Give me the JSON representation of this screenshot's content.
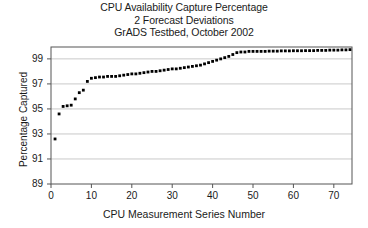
{
  "chart_data": {
    "type": "scatter",
    "title": "CPU Availability Capture Percentage",
    "subtitle": "2 Forecast Deviations",
    "subtitle2": "GrADS Testbed, October 2002",
    "xlabel": "CPU Measurement Series Number",
    "ylabel": "Percentage Captured",
    "xlim": [
      0,
      74.5
    ],
    "ylim": [
      89,
      99.95
    ],
    "xticks": [
      0,
      10,
      20,
      30,
      40,
      50,
      60,
      70
    ],
    "yticks": [
      89,
      91,
      93,
      95,
      97,
      99
    ],
    "grid": "horizontal",
    "legend": "none",
    "marker": "filled-square",
    "marker_color": "#000000",
    "x": [
      1,
      2,
      3,
      4,
      5,
      6,
      7,
      8,
      9,
      10,
      11,
      12,
      13,
      14,
      15,
      16,
      17,
      18,
      19,
      20,
      21,
      22,
      23,
      24,
      25,
      26,
      27,
      28,
      29,
      30,
      31,
      32,
      33,
      34,
      35,
      36,
      37,
      38,
      39,
      40,
      41,
      42,
      43,
      44,
      45,
      46,
      47,
      48,
      49,
      50,
      51,
      52,
      53,
      54,
      55,
      56,
      57,
      58,
      59,
      60,
      61,
      62,
      63,
      64,
      65,
      66,
      67,
      68,
      69,
      70,
      71,
      72,
      73,
      74
    ],
    "y": [
      92.6,
      94.6,
      95.2,
      95.25,
      95.3,
      95.8,
      96.3,
      96.5,
      97.2,
      97.45,
      97.5,
      97.55,
      97.55,
      97.6,
      97.6,
      97.6,
      97.65,
      97.7,
      97.75,
      97.8,
      97.8,
      97.85,
      97.9,
      97.95,
      98.0,
      98.0,
      98.05,
      98.1,
      98.15,
      98.2,
      98.2,
      98.25,
      98.3,
      98.35,
      98.4,
      98.45,
      98.5,
      98.6,
      98.7,
      98.8,
      98.9,
      99.0,
      99.1,
      99.2,
      99.35,
      99.5,
      99.55,
      99.55,
      99.6,
      99.6,
      99.6,
      99.6,
      99.6,
      99.62,
      99.62,
      99.62,
      99.64,
      99.64,
      99.64,
      99.65,
      99.65,
      99.65,
      99.66,
      99.66,
      99.66,
      99.68,
      99.68,
      99.68,
      99.7,
      99.7,
      99.7,
      99.72,
      99.72,
      99.74
    ]
  }
}
